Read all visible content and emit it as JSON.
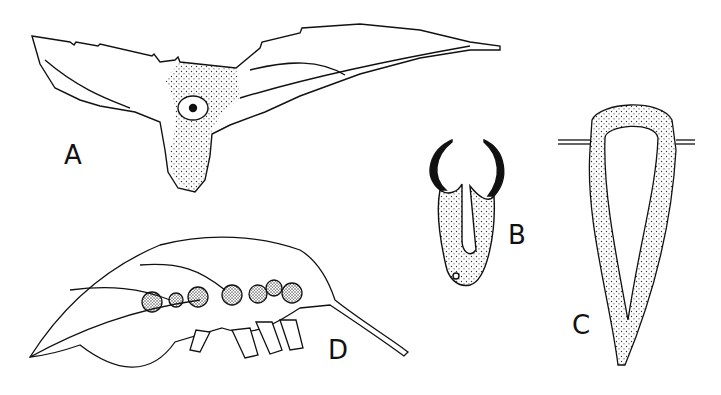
{
  "figure": {
    "panels": [
      {
        "id": "A",
        "label": "A",
        "description": "Leaf base with swollen stippled gall and central opening"
      },
      {
        "id": "B",
        "label": "B",
        "description": "Section of small gall with curled lobes"
      },
      {
        "id": "C",
        "label": "C",
        "description": "Longitudinal section of elongated gall through leaf blade"
      },
      {
        "id": "D",
        "label": "D",
        "description": "Leaf with row of rounded galls along midrib and projections beneath"
      }
    ],
    "colors": {
      "ink": "#111111",
      "stipple": "#333333",
      "background": "#ffffff"
    }
  }
}
